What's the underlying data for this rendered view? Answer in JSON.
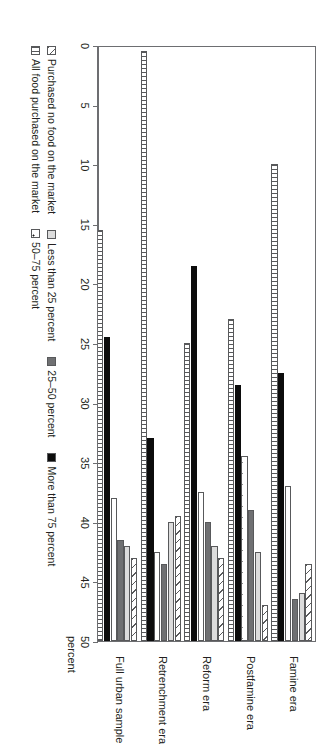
{
  "chart_data": {
    "type": "bar",
    "orientation": "horizontal-rotated",
    "title": "",
    "xlabel": "percent",
    "ylabel": "",
    "xlim": [
      0,
      50
    ],
    "grid": false,
    "legend_position": "bottom",
    "ticks": [
      0,
      5,
      10,
      15,
      20,
      25,
      30,
      35,
      40,
      45,
      50
    ],
    "categories": [
      "Famine era",
      "Postfamine era",
      "Reform era",
      "Retrenchment era",
      "Full urban sample"
    ],
    "series": [
      {
        "name": "Purchased no food on the market",
        "pattern": "diagonal-hatch",
        "values": [
          6.5,
          3.0,
          7.0,
          10.5,
          7.0
        ]
      },
      {
        "name": "Less than 25 percent",
        "pattern": "light-gray",
        "values": [
          4.0,
          7.5,
          8.0,
          10.0,
          8.0
        ]
      },
      {
        "name": "25–50 percent",
        "pattern": "dark-gray",
        "values": [
          3.5,
          11.0,
          10.0,
          6.5,
          8.5
        ]
      },
      {
        "name": "50–75 percent",
        "pattern": "white-dots",
        "values": [
          13.0,
          15.5,
          12.5,
          7.5,
          12.0
        ]
      },
      {
        "name": "More than 75 percent",
        "pattern": "solid-black",
        "values": [
          22.5,
          21.5,
          31.5,
          17.0,
          25.5
        ]
      },
      {
        "name": "All food purchased on the market",
        "pattern": "vertical-stripe",
        "values": [
          40.0,
          27.0,
          25.0,
          49.5,
          34.5
        ]
      }
    ]
  },
  "legend": {
    "row1": [
      "Purchased no food on the market",
      "Less than 25 percent",
      "25–50 percent",
      "More than 75 percent"
    ],
    "row2": [
      "All food purchased on the market",
      "50–75 percent"
    ],
    "items": [
      "Purchased no food on the market",
      "Less than 25 percent",
      "25–50 percent",
      "More than 75 percent",
      "All food purchased on the market",
      "50–75 percent"
    ]
  }
}
